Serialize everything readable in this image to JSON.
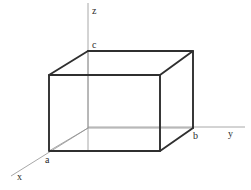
{
  "figure": {
    "background_color": "#ffffff",
    "width": 251,
    "height": 190,
    "colors": {
      "solid_edge": "#2f2f2f",
      "hidden_edge": "#8f8f8f",
      "axis": "#a8a8a8",
      "label_text": "#2b2b2b"
    },
    "stroke_widths": {
      "solid_edge": 1.9,
      "hidden_edge": 0.8,
      "axis": 1.0
    }
  },
  "axes": [
    {
      "name": "x-axis",
      "label": "x",
      "label_x": 17,
      "label_y": 172,
      "x1": 88,
      "y1": 128,
      "x2": 11,
      "y2": 176
    },
    {
      "name": "y-axis",
      "label": "y",
      "label_x": 228,
      "label_y": 129,
      "x1": 88,
      "y1": 127,
      "x2": 245,
      "y2": 127
    },
    {
      "name": "z-axis",
      "label": "z",
      "label_x": 92,
      "label_y": 6,
      "x1": 88,
      "y1": 3,
      "x2": 88,
      "y2": 152
    }
  ],
  "vertex_labels": [
    {
      "name": "vertex-a",
      "label": "a",
      "x": 45,
      "y": 155
    },
    {
      "name": "vertex-b",
      "label": "b",
      "x": 193,
      "y": 131
    },
    {
      "name": "vertex-c",
      "label": "c",
      "x": 92,
      "y": 40
    }
  ],
  "geometry": {
    "front_face": {
      "x": 49,
      "y": 75,
      "w": 111,
      "h": 76
    },
    "back_face": {
      "x": 88,
      "y": 51,
      "w": 105,
      "h": 77
    },
    "front_face_points": "49,75 160,75 160,151 49,151",
    "back_face_points": "88,51 193,51 193,128 88,128",
    "solid_edges": [
      {
        "name": "front-top-edge",
        "x1": 49,
        "y1": 75,
        "x2": 160,
        "y2": 75
      },
      {
        "name": "front-left-edge",
        "x1": 49,
        "y1": 75,
        "x2": 49,
        "y2": 151
      },
      {
        "name": "front-right-edge",
        "x1": 160,
        "y1": 75,
        "x2": 160,
        "y2": 151
      },
      {
        "name": "front-bottom-edge",
        "x1": 49,
        "y1": 151,
        "x2": 160,
        "y2": 151
      },
      {
        "name": "back-top-edge",
        "x1": 88,
        "y1": 51,
        "x2": 193,
        "y2": 51
      },
      {
        "name": "back-right-edge",
        "x1": 193,
        "y1": 51,
        "x2": 193,
        "y2": 128
      },
      {
        "name": "connector-top-left",
        "x1": 49,
        "y1": 75,
        "x2": 88,
        "y2": 51
      },
      {
        "name": "connector-top-right",
        "x1": 160,
        "y1": 75,
        "x2": 193,
        "y2": 51
      },
      {
        "name": "connector-bottom-right",
        "x1": 160,
        "y1": 151,
        "x2": 193,
        "y2": 128
      }
    ],
    "hidden_edges": [
      {
        "name": "back-left-edge",
        "x1": 88,
        "y1": 51,
        "x2": 88,
        "y2": 128
      },
      {
        "name": "back-bottom-edge",
        "x1": 88,
        "y1": 128,
        "x2": 193,
        "y2": 128
      },
      {
        "name": "connector-bottom-left",
        "x1": 49,
        "y1": 151,
        "x2": 88,
        "y2": 128
      }
    ]
  }
}
